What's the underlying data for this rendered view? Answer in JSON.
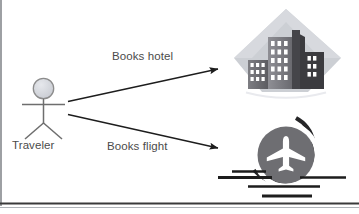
{
  "diagram": {
    "type": "use-case-diagram",
    "background_color": "#ffffff",
    "border_color": "#3a3a3a",
    "actors": [
      {
        "id": "traveler",
        "label": "Traveler",
        "shape": "stick-figure",
        "head_fill": "#d4d6dc",
        "head_stroke": "#8c8c8c",
        "line_color": "#6e6e6e"
      }
    ],
    "edges": [
      {
        "id": "books-hotel",
        "label": "Books hotel",
        "from": "traveler",
        "to": "hotel",
        "color": "#1d1d1d",
        "arrowhead": "filled-triangle"
      },
      {
        "id": "books-flight",
        "label": "Books flight",
        "from": "traveler",
        "to": "flight",
        "color": "#1d1d1d",
        "arrowhead": "filled-triangle"
      }
    ],
    "nodes": [
      {
        "id": "hotel",
        "icon_name": "hotel-buildings-icon",
        "backdrop_shape": "diamond",
        "backdrop_fill": "#c9ccd2",
        "building_dark": "#3b3b3f",
        "building_mid": "#6b6b70",
        "building_light": "#8e8e93",
        "window_fill": "#ffffff"
      },
      {
        "id": "flight",
        "icon_name": "airplane-circle-icon",
        "circle_fill": "#6e6e72",
        "plane_fill": "#ffffff",
        "arc_color": "#262628",
        "runway_line_color": "#1d1d1d"
      }
    ]
  }
}
